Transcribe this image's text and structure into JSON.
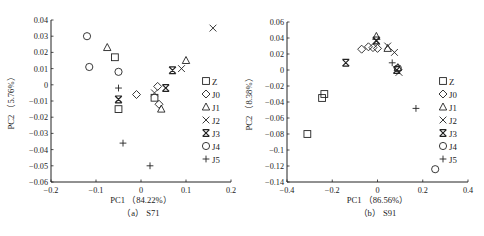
{
  "chart_data": [
    {
      "type": "scatter",
      "panel_caption": "(a) S71",
      "xlabel": "PC1 (84.22%)",
      "ylabel": "PC2 (5.76%)",
      "xlim": [
        -0.2,
        0.2
      ],
      "ylim": [
        -0.06,
        0.04
      ],
      "xticks": [
        -0.2,
        -0.1,
        0,
        0.1,
        0.2
      ],
      "yticks": [
        0.04,
        0.03,
        0.02,
        0.01,
        0,
        -0.01,
        -0.02,
        -0.03,
        -0.04,
        -0.05,
        -0.06
      ],
      "xtick_labels": [
        "-0.2",
        "-0.1",
        "0",
        "0.1",
        "0.2"
      ],
      "ytick_labels": [
        "0.04",
        "0.03",
        "0.02",
        "0.01",
        "0",
        "-0.01",
        "-0.02",
        "-0.03",
        "-0.04",
        "-0.05",
        "-0.06"
      ],
      "grid": false,
      "legend_position": "right",
      "series": [
        {
          "name": "Z",
          "marker": "square",
          "points": [
            [
              -0.058,
              0.017
            ],
            [
              -0.05,
              -0.015
            ],
            [
              0.03,
              -0.008
            ]
          ]
        },
        {
          "name": "J0",
          "marker": "diamond",
          "points": [
            [
              -0.01,
              -0.006
            ],
            [
              0.037,
              -0.001
            ],
            [
              0.04,
              -0.012
            ]
          ]
        },
        {
          "name": "J1",
          "marker": "triangle",
          "points": [
            [
              -0.075,
              0.023
            ],
            [
              0.045,
              -0.015
            ],
            [
              0.1,
              0.015
            ]
          ]
        },
        {
          "name": "J2",
          "marker": "x",
          "points": [
            [
              0.03,
              -0.005
            ],
            [
              0.09,
              0.01
            ],
            [
              0.16,
              0.035
            ]
          ]
        },
        {
          "name": "J3",
          "marker": "asterisk",
          "points": [
            [
              -0.05,
              -0.009
            ],
            [
              0.055,
              -0.002
            ],
            [
              0.07,
              0.009
            ]
          ]
        },
        {
          "name": "J4",
          "marker": "circle",
          "points": [
            [
              -0.12,
              0.03
            ],
            [
              -0.115,
              0.011
            ],
            [
              -0.05,
              0.008
            ]
          ]
        },
        {
          "name": "J5",
          "marker": "plus",
          "points": [
            [
              -0.05,
              -0.002
            ],
            [
              -0.04,
              -0.036
            ],
            [
              0.02,
              -0.05
            ]
          ]
        }
      ]
    },
    {
      "type": "scatter",
      "panel_caption": "(b) S91",
      "xlabel": "PC1 (86.56%)",
      "ylabel": "PC2 (8.38%)",
      "xlim": [
        -0.4,
        0.4
      ],
      "ylim": [
        -0.14,
        0.06
      ],
      "xticks": [
        -0.4,
        -0.2,
        0,
        0.2,
        0.4
      ],
      "yticks": [
        0.06,
        0.04,
        0.02,
        0,
        -0.02,
        -0.04,
        -0.06,
        -0.08,
        -0.1,
        -0.12,
        -0.14
      ],
      "xtick_labels": [
        "-0.4",
        "-0.2",
        "0",
        "0.2",
        "0.4"
      ],
      "ytick_labels": [
        "0.06",
        "0.04",
        "0.02",
        "0",
        "-0.02",
        "-0.04",
        "-0.06",
        "-0.08",
        "-0.1",
        "-0.12",
        "-0.14"
      ],
      "grid": false,
      "legend_position": "right",
      "series": [
        {
          "name": "Z",
          "marker": "square",
          "points": [
            [
              -0.245,
              -0.035
            ],
            [
              -0.235,
              -0.03
            ],
            [
              -0.31,
              -0.08
            ]
          ]
        },
        {
          "name": "J0",
          "marker": "diamond",
          "points": [
            [
              -0.07,
              0.026
            ],
            [
              -0.04,
              0.029
            ],
            [
              -0.02,
              0.028
            ],
            [
              0.0,
              0.027
            ]
          ]
        },
        {
          "name": "J1",
          "marker": "triangle",
          "points": [
            [
              -0.005,
              0.042
            ],
            [
              0.045,
              0.027
            ],
            [
              0.09,
              0.003
            ]
          ]
        },
        {
          "name": "J2",
          "marker": "x",
          "points": [
            [
              -0.005,
              0.036
            ],
            [
              0.045,
              0.03
            ],
            [
              0.075,
              0.022
            ],
            [
              0.095,
              -0.003
            ]
          ]
        },
        {
          "name": "J3",
          "marker": "asterisk",
          "points": [
            [
              -0.14,
              0.009
            ],
            [
              -0.005,
              0.037
            ],
            [
              0.085,
              0.0
            ]
          ]
        },
        {
          "name": "J4",
          "marker": "circle",
          "points": [
            [
              0.09,
              0.002
            ],
            [
              0.255,
              -0.124
            ]
          ]
        },
        {
          "name": "J5",
          "marker": "plus",
          "points": [
            [
              0.065,
              0.009
            ],
            [
              0.17,
              -0.048
            ]
          ]
        }
      ]
    }
  ],
  "legend_labels": [
    "Z",
    "J0",
    "J1",
    "J2",
    "J3",
    "J4",
    "J5"
  ]
}
